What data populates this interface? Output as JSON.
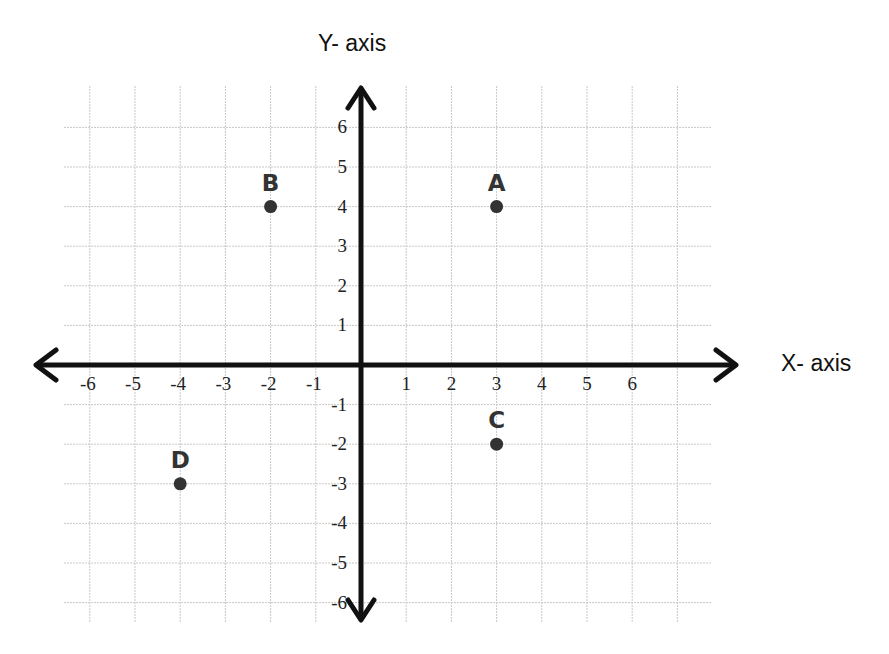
{
  "chart_data": {
    "type": "scatter",
    "title": "",
    "xlabel": "X- axis",
    "ylabel": "Y- axis",
    "xlim": [
      -6,
      6
    ],
    "ylim": [
      -6,
      6
    ],
    "grid": true,
    "x_ticks": [
      "-6",
      "-5",
      "-4",
      "-3",
      "-2",
      "-1",
      "1",
      "2",
      "3",
      "4",
      "5",
      "6"
    ],
    "y_ticks": [
      "6",
      "5",
      "4",
      "3",
      "2",
      "1",
      "-1",
      "-2",
      "-3",
      "-4",
      "-5",
      "-6"
    ],
    "points": [
      {
        "label": "A",
        "x": 3,
        "y": 4
      },
      {
        "label": "B",
        "x": -2,
        "y": 4
      },
      {
        "label": "C",
        "x": 3,
        "y": -2
      },
      {
        "label": "D",
        "x": -4,
        "y": -3
      }
    ],
    "colors": {
      "axis": "#111111",
      "grid": "#c8c8c8",
      "point": "#333333",
      "label": "#333333"
    }
  },
  "axes": {
    "x_title": "X- axis",
    "y_title": "Y- axis"
  }
}
